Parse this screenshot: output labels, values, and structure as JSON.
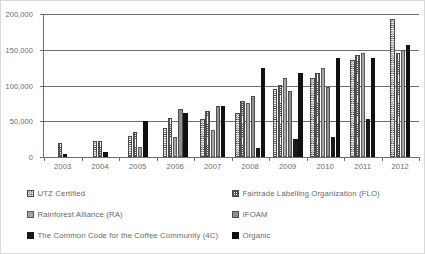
{
  "chart_data": {
    "type": "bar",
    "title": "",
    "subtitle": "",
    "xlabel": "",
    "ylabel": "",
    "ylim": [
      0,
      200000
    ],
    "ytick_values": [
      0,
      50000,
      100000,
      150000,
      200000
    ],
    "ytick_labels": [
      "0",
      "50,000",
      "100,000",
      "150,000",
      "200,000"
    ],
    "grid": true,
    "legend_position": "bottom",
    "categories": [
      "2003",
      "2004",
      "2005",
      "2006",
      "2007",
      "2008",
      "2009",
      "2010",
      "2011",
      "2012"
    ],
    "series": [
      {
        "name": "UTZ Certified",
        "key": "utz",
        "pattern": "white-with-black-dots",
        "color": "#ffffff",
        "values": [
          0,
          22000,
          29000,
          41000,
          53000,
          62000,
          95000,
          110000,
          135000,
          193000
        ]
      },
      {
        "name": "Fairtrade Labelling Organization (FLO)",
        "key": "flo",
        "pattern": "white-with-fine-grid",
        "color": "#ffffff",
        "values": [
          19000,
          23000,
          35000,
          55000,
          65000,
          78000,
          101000,
          118000,
          143000,
          145000
        ]
      },
      {
        "name": "Rainforest Alliance (RA)",
        "key": "ra",
        "pattern": "light-gray-solid",
        "color": "#a6a6a6",
        "values": [
          0,
          0,
          14000,
          28000,
          38000,
          75000,
          110000,
          124000,
          146000,
          150000
        ]
      },
      {
        "name": "IFOAM",
        "key": "ifoam",
        "pattern": "medium-gray-solid",
        "color": "#8f8f8f",
        "values": [
          0,
          0,
          0,
          67000,
          71000,
          86000,
          93000,
          98000,
          0,
          0
        ]
      },
      {
        "name": "The Common Code for the Coffee Community (4C)",
        "key": "fourc",
        "pattern": "black-solid",
        "color": "#1a1a1a",
        "values": [
          0,
          0,
          0,
          0,
          0,
          13000,
          25000,
          28000,
          53000,
          0
        ]
      },
      {
        "name": "Organic",
        "key": "organic",
        "pattern": "black-solid",
        "color": "#111111",
        "values": [
          4000,
          7000,
          50000,
          62000,
          72000,
          124000,
          118000,
          138000,
          139000,
          156000
        ]
      }
    ]
  },
  "legend": {
    "items": [
      {
        "label": "UTZ Certified",
        "key": "utz"
      },
      {
        "label": "Fairtrade Labelling Organization (FLO)",
        "key": "flo"
      },
      {
        "label": "Rainforest Alliance (RA)",
        "key": "ra"
      },
      {
        "label": "IFOAM",
        "key": "ifoam"
      },
      {
        "label": "The Common Code for the Coffee Community (4C)",
        "key": "fourc"
      },
      {
        "label": "Organic",
        "key": "organic"
      }
    ]
  }
}
